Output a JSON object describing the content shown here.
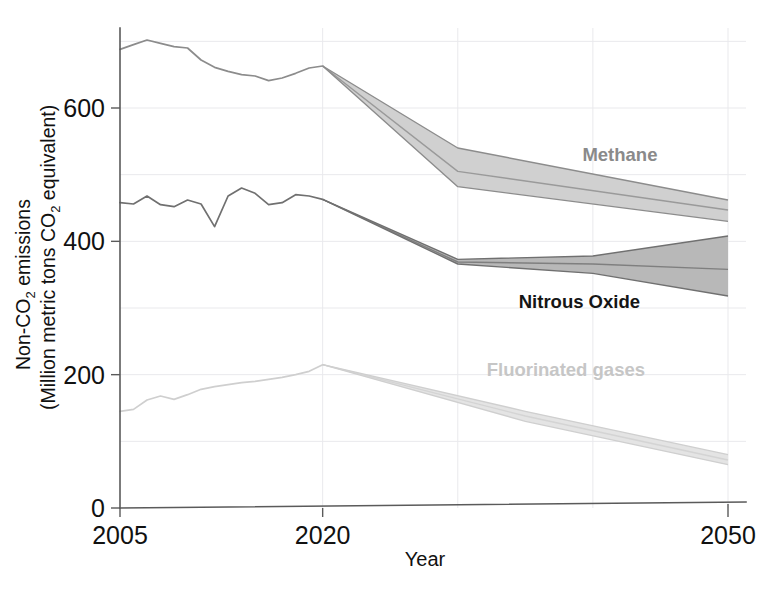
{
  "chart_data": {
    "type": "area",
    "title": "",
    "xlabel": "Year",
    "ylabel": "Non-CO2 emissions (Million metric tons CO2 equivalent)",
    "ylabel_line1": "Non-CO",
    "ylabel_line1_sub": "2",
    "ylabel_line1_tail": " emissions",
    "ylabel_line2_head": "(Million metric tons CO",
    "ylabel_line2_sub": "2",
    "ylabel_line2_tail": " equivalent)",
    "xlim": [
      2005,
      2050
    ],
    "ylim": [
      0,
      720
    ],
    "xticks": [
      2005,
      2020,
      2050
    ],
    "xtick_labels": [
      "2005",
      "2020",
      "2050"
    ],
    "yticks": [
      0,
      200,
      400,
      600
    ],
    "ytick_labels": [
      "0",
      "200",
      "400",
      "600"
    ],
    "grid": "faint vertical gridlines at 2020, 2030, 2040, 2050; faint horizontal gridlines every 100",
    "gridlines_x": [
      2020,
      2030,
      2040,
      2050
    ],
    "gridlines_y": [
      100,
      200,
      300,
      400,
      500,
      600,
      700
    ],
    "legend_position": "inline-right-annotations",
    "history_end_year": 2020,
    "series": [
      {
        "name": "Methane",
        "label": "Methane",
        "color": "#8c8c8c",
        "label_color": "#8a8a8a",
        "band_fill": "#d0d0d0",
        "history_x": [
          2005,
          2006,
          2007,
          2008,
          2009,
          2010,
          2011,
          2012,
          2013,
          2014,
          2015,
          2016,
          2017,
          2018,
          2019,
          2020
        ],
        "history_y": [
          688,
          695,
          702,
          697,
          692,
          690,
          672,
          661,
          655,
          650,
          648,
          641,
          645,
          652,
          660,
          663
        ],
        "projection_x": [
          2020,
          2030,
          2050
        ],
        "projection_upper": [
          663,
          540,
          462
        ],
        "projection_mid": [
          663,
          505,
          447
        ],
        "projection_lower": [
          663,
          482,
          430
        ]
      },
      {
        "name": "Nitrous Oxide",
        "label": "Nitrous Oxide",
        "color": "#707070",
        "label_color": "#151515",
        "band_fill": "#b8b8b8",
        "history_x": [
          2005,
          2006,
          2007,
          2008,
          2009,
          2010,
          2011,
          2012,
          2013,
          2014,
          2015,
          2016,
          2017,
          2018,
          2019,
          2020
        ],
        "history_y": [
          458,
          456,
          468,
          455,
          452,
          462,
          456,
          422,
          468,
          480,
          472,
          455,
          458,
          470,
          468,
          463
        ],
        "projection_x": [
          2020,
          2030,
          2040,
          2050
        ],
        "projection_upper": [
          463,
          373,
          378,
          408
        ],
        "projection_mid": [
          463,
          369,
          366,
          358
        ],
        "projection_lower": [
          463,
          366,
          352,
          318
        ]
      },
      {
        "name": "Fluorinated gases",
        "label": "Fluorinated gases",
        "color": "#cfcfcf",
        "label_color": "#c6c6c6",
        "band_fill": "#e4e4e4",
        "history_x": [
          2005,
          2006,
          2007,
          2008,
          2009,
          2010,
          2011,
          2012,
          2013,
          2014,
          2015,
          2016,
          2017,
          2018,
          2019,
          2020
        ],
        "history_y": [
          145,
          148,
          162,
          168,
          163,
          170,
          178,
          182,
          185,
          188,
          190,
          193,
          196,
          200,
          205,
          215
        ],
        "projection_x": [
          2020,
          2035,
          2050
        ],
        "projection_upper": [
          215,
          145,
          80
        ],
        "projection_mid": [
          215,
          138,
          72
        ],
        "projection_lower": [
          215,
          130,
          65
        ]
      }
    ],
    "annotations": [
      {
        "text": "Methane",
        "x": 2042,
        "y": 520,
        "color": "#8a8a8a"
      },
      {
        "text": "Nitrous Oxide",
        "x": 2039,
        "y": 300,
        "color": "#151515"
      },
      {
        "text": "Fluorinated gases",
        "x": 2038,
        "y": 198,
        "color": "#c6c6c6"
      }
    ]
  }
}
